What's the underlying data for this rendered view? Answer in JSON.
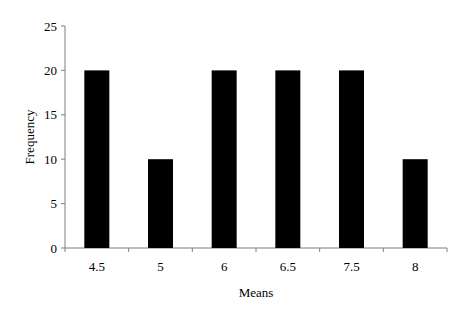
{
  "chart_data": {
    "type": "bar",
    "title": "",
    "xlabel": "Means",
    "ylabel": "Frequency",
    "categories": [
      "4.5",
      "5",
      "6",
      "6.5",
      "7.5",
      "8"
    ],
    "values": [
      20,
      10,
      20,
      20,
      20,
      10
    ],
    "ylim": [
      0,
      25
    ],
    "yticks": [
      0,
      5,
      10,
      15,
      20,
      25
    ],
    "grid": false,
    "legend": null,
    "bar_color": "#000000"
  }
}
